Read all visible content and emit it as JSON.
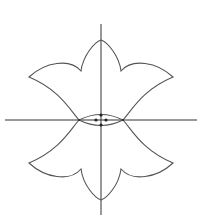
{
  "diagram": {
    "stroke_color": "#555555",
    "axis_color": "#333333",
    "point_color": "#222222",
    "axes": {
      "horizontal": {
        "x1": 5,
        "y1": 120,
        "x2": 197,
        "y2": 120
      },
      "vertical": {
        "x1": 101,
        "y1": 24,
        "x2": 101,
        "y2": 215
      }
    },
    "upper_curve": "M79,120 C70,110 60,90 29,77 C45,62 70,58 81,71 C83,55 95,42 101,40 C107,42 119,55 121,71 C132,58 157,62 173,77 C142,90 132,110 123,120",
    "lower_curve": "M79,120 C70,130 60,150 29,163 C45,178 70,182 81,169 C83,185 95,198 101,200 C107,198 119,185 121,169 C132,182 157,178 173,163 C142,150 132,130 123,120",
    "lens_upper": "M79,120 Q101,109 123,120",
    "lens_lower": "M79,120 Q101,131 123,120",
    "points": [
      {
        "name": "top-point",
        "cx": 101,
        "cy": 115
      },
      {
        "name": "bottom-point",
        "cx": 101,
        "cy": 125
      },
      {
        "name": "left-point",
        "cx": 96,
        "cy": 120
      },
      {
        "name": "right-point",
        "cx": 106,
        "cy": 120
      },
      {
        "name": "left-intersection",
        "cx": 79,
        "cy": 120
      },
      {
        "name": "right-intersection",
        "cx": 123,
        "cy": 120
      }
    ]
  }
}
